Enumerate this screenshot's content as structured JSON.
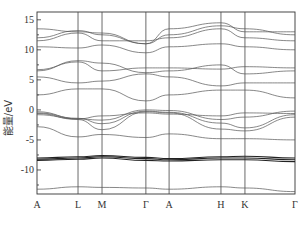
{
  "chart_data": {
    "type": "line",
    "title": "",
    "xlabel": "",
    "ylabel": "能量/eV",
    "ylim": [
      -14,
      16.3
    ],
    "yticks": [
      15,
      10,
      5,
      0,
      -5,
      -10
    ],
    "ytick_labels": [
      "15",
      "10",
      "5",
      "0",
      "-5",
      "-10"
    ],
    "x": [
      "A",
      "L",
      "M",
      "Γ",
      "A",
      "H",
      "K",
      "Γ"
    ],
    "xtick_labels": [
      "A",
      "L",
      "M",
      "Γ",
      "A",
      "H",
      "K",
      "Γ"
    ],
    "x_positions_rel": [
      0,
      0.159,
      0.252,
      0.422,
      0.512,
      0.713,
      0.806,
      1.0
    ],
    "grid": false,
    "legend": null,
    "series": [
      {
        "name": "band-1",
        "values": [
          -13.2,
          -12.8,
          -12.9,
          -13.0,
          -13.2,
          -12.8,
          -13.0,
          -13.6
        ]
      },
      {
        "name": "band-2",
        "values": [
          -8.2,
          -8.0,
          -7.8,
          -8.1,
          -8.3,
          -8.0,
          -8.0,
          -8.3
        ]
      },
      {
        "name": "band-3",
        "values": [
          -8.0,
          -7.8,
          -7.6,
          -7.9,
          -8.1,
          -7.8,
          -7.7,
          -8.0
        ]
      },
      {
        "name": "band-4",
        "values": [
          -8.4,
          -8.2,
          -8.0,
          -8.4,
          -8.5,
          -8.3,
          -8.3,
          -8.6
        ]
      },
      {
        "name": "band-5",
        "values": [
          -2.8,
          -4.5,
          -4.1,
          -4.6,
          -4.0,
          -4.8,
          -4.8,
          -5.0
        ]
      },
      {
        "name": "band-6",
        "values": [
          -0.3,
          -1.5,
          -1.7,
          0.0,
          -0.1,
          -1.6,
          -1.2,
          -0.2
        ]
      },
      {
        "name": "band-7",
        "values": [
          -0.5,
          -1.4,
          -2.3,
          -0.2,
          -0.4,
          -2.2,
          -3.0,
          -0.8
        ]
      },
      {
        "name": "band-8",
        "values": [
          -0.6,
          -1.6,
          -3.3,
          -0.3,
          -0.5,
          -3.2,
          -3.5,
          -1.2
        ]
      },
      {
        "name": "band-9",
        "values": [
          -0.8,
          -1.5,
          -1.0,
          -0.5,
          -0.7,
          -1.0,
          -0.5,
          -0.6
        ]
      },
      {
        "name": "band-10",
        "values": [
          2.5,
          3.5,
          3.5,
          1.5,
          2.5,
          3.3,
          3.3,
          2.0
        ]
      },
      {
        "name": "band-11",
        "values": [
          5.5,
          4.5,
          4.8,
          6.0,
          5.5,
          4.0,
          4.5,
          4.5
        ]
      },
      {
        "name": "band-12",
        "values": [
          6.5,
          8.2,
          7.8,
          6.2,
          6.5,
          7.5,
          6.0,
          6.5
        ]
      },
      {
        "name": "band-13",
        "values": [
          6.7,
          8.0,
          6.5,
          7.0,
          7.0,
          6.8,
          7.2,
          7.0
        ]
      },
      {
        "name": "band-14",
        "values": [
          10.5,
          10.3,
          10.8,
          9.5,
          10.5,
          11.0,
          10.5,
          10.0
        ]
      },
      {
        "name": "band-15",
        "values": [
          11.5,
          12.8,
          11.5,
          11.5,
          12.0,
          13.5,
          12.0,
          11.5
        ]
      },
      {
        "name": "band-16",
        "values": [
          12.0,
          13.2,
          12.5,
          11.0,
          12.5,
          14.0,
          13.5,
          12.5
        ]
      },
      {
        "name": "band-17",
        "values": [
          13.5,
          13.0,
          12.8,
          11.0,
          13.5,
          14.5,
          13.0,
          13.0
        ]
      }
    ]
  }
}
